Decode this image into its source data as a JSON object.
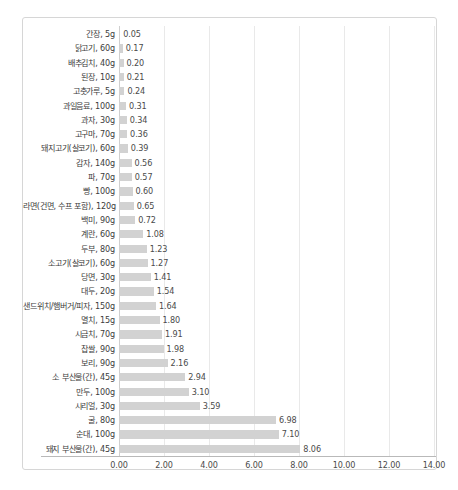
{
  "chart_data": {
    "type": "bar",
    "orientation": "horizontal",
    "title": "",
    "subtitle": "",
    "xlabel": "",
    "ylabel": "",
    "xlim": [
      0,
      14
    ],
    "xtick_step": 2,
    "grid": true,
    "legend": null,
    "value_label_format": "0.00",
    "bar_color": "#d2d2d2",
    "gridline_color": "#e9e9e9",
    "axis_color": "#b9b9b9",
    "frame_color": "#d6d6d6",
    "text_color": "#3c3c3c",
    "xticks": [
      "0.00",
      "2.00",
      "4.00",
      "6.00",
      "8.00",
      "10.00",
      "12.00",
      "14.00"
    ],
    "xtick_values": [
      0,
      2,
      4,
      6,
      8,
      10,
      12,
      14
    ],
    "categories": [
      "간장, 5g",
      "닭고기, 60g",
      "배추김치, 40g",
      "된장, 10g",
      "고춧가루, 5g",
      "과일음료, 100g",
      "과자, 30g",
      "고구마, 70g",
      "돼지고기(살코기), 60g",
      "감자, 140g",
      "파, 70g",
      "빵, 100g",
      "라면(건면, 수프 포함), 120g",
      "백미, 90g",
      "계란, 60g",
      "두부, 80g",
      "소고기(살코기), 60g",
      "당면, 30g",
      "대두, 20g",
      "샌드위치/햄버거/피자, 150g",
      "멸치, 15g",
      "시금치, 70g",
      "찹쌀, 90g",
      "보리, 90g",
      "소 부산물(간), 45g",
      "만두, 100g",
      "시리얼, 30g",
      "굴, 80g",
      "순대, 100g",
      "돼지 부산물(간), 45g"
    ],
    "values": [
      0.05,
      0.17,
      0.2,
      0.21,
      0.24,
      0.31,
      0.34,
      0.36,
      0.39,
      0.56,
      0.57,
      0.6,
      0.65,
      0.72,
      1.08,
      1.23,
      1.27,
      1.41,
      1.54,
      1.64,
      1.8,
      1.91,
      1.98,
      2.16,
      2.94,
      3.1,
      3.59,
      6.98,
      7.1,
      8.06
    ],
    "value_labels": [
      "0.05",
      "0.17",
      "0.20",
      "0.21",
      "0.24",
      "0.31",
      "0.34",
      "0.36",
      "0.39",
      "0.56",
      "0.57",
      "0.60",
      "0.65",
      "0.72",
      "1.08",
      "1.23",
      "1.27",
      "1.41",
      "1.54",
      "1.64",
      "1.80",
      "1.91",
      "1.98",
      "2.16",
      "2.94",
      "3.10",
      "3.59",
      "6.98",
      "7.10",
      "8.06"
    ]
  }
}
